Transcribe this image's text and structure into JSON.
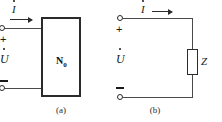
{
  "figure": {
    "type": "circuit-diagram",
    "colors": {
      "ink": "#1a1a1a",
      "wire": "#4a4a4a",
      "outline": "#2b2b2b",
      "background": "#ffffff"
    }
  },
  "panel_a": {
    "caption": "(a)",
    "block_label": "N",
    "block_label_sub": "0",
    "current_symbol": "I",
    "voltage_symbol": "U",
    "plus_sign": "+",
    "minus_sign": "−",
    "terminals": [
      {
        "name": "top-terminal",
        "polarity": "+"
      },
      {
        "name": "bottom-terminal",
        "polarity": "−"
      }
    ]
  },
  "panel_b": {
    "caption": "(b)",
    "impedance_label": "Z",
    "current_symbol": "I",
    "voltage_symbol": "U",
    "plus_sign": "+",
    "minus_sign": "−",
    "terminals": [
      {
        "name": "top-terminal",
        "polarity": "+"
      },
      {
        "name": "bottom-terminal",
        "polarity": "−"
      }
    ]
  }
}
